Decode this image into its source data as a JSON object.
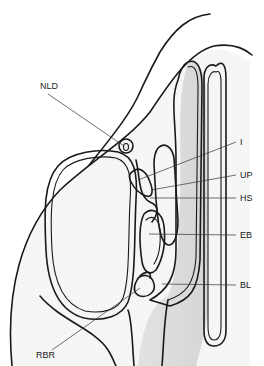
{
  "figure": {
    "colors": {
      "background": "#ffffff",
      "line": "#1a1a1a",
      "mucosa_fill": "#f1f1f1",
      "cavity_fill": "#e6e6e6",
      "sinus_fill": "#fafafa"
    },
    "labels": [
      {
        "id": "NLD",
        "text": "NLD",
        "x": 40,
        "y": 89,
        "pointer_to": [
          124,
          146
        ]
      },
      {
        "id": "I",
        "text": "I",
        "x": 240,
        "y": 145,
        "pointer_to": [
          138,
          180
        ]
      },
      {
        "id": "UP",
        "text": "UP",
        "x": 240,
        "y": 178,
        "pointer_to": [
          151,
          190
        ]
      },
      {
        "id": "HS",
        "text": "HS",
        "x": 240,
        "y": 201,
        "pointer_to": [
          150,
          198
        ]
      },
      {
        "id": "EB",
        "text": "EB",
        "x": 240,
        "y": 238,
        "pointer_to": [
          149,
          234
        ]
      },
      {
        "id": "BL",
        "text": "BL",
        "x": 240,
        "y": 288,
        "pointer_to": [
          162,
          284
        ]
      },
      {
        "id": "RBR",
        "text": "RBR",
        "x": 36,
        "y": 358,
        "pointer_to": [
          140,
          288
        ]
      }
    ]
  }
}
